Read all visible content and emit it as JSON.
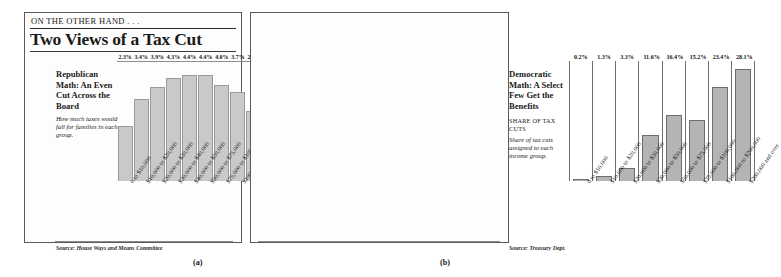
{
  "header": {
    "kicker": "ON THE OTHER HAND . . .",
    "title": "Two Views of a Tax Cut"
  },
  "panel_a": {
    "heading": "Republican Math: An Even Cut Across the Board",
    "description": "How much taxes would fall for families in each group.",
    "source": "Source: House Ways and Means Committee",
    "figure_caption": "(a)"
  },
  "panel_b": {
    "heading": "Democratic Math: A Select Few Get the Benefits",
    "subhead": "SHARE OF TAX CUTS",
    "description": "Share of tax cuts assigned to each income group.",
    "source": "Source: Treasury Dept.",
    "figure_caption": "(b)"
  },
  "colors": {
    "bar_a_fill": "#c9c9c9",
    "bar_a_stroke": "#9a9a9a",
    "bar_b_fill": "#b4b4b4",
    "bar_b_stroke": "#6d6d6d",
    "panel_border": "#5a5a5a",
    "text": "#1a1a1a"
  },
  "chart_data": [
    {
      "type": "bar",
      "title": "Republican Math: An Even Cut Across the Board",
      "subtitle": "How much taxes would fall for families in each group.",
      "xlabel": "",
      "ylabel": "",
      "ylim": [
        0,
        5.0
      ],
      "grid": false,
      "legend": "none",
      "source": "Source: House Ways and Means Committee",
      "categories": [
        "0 to $10,000",
        "$10,000 to $20,000",
        "$20,000 to $30,000",
        "$30,000 to $40,000",
        "$40,000 to $50,000",
        "$50,000 to $75,000",
        "$75,000 to $100,000",
        "$100,000 to $200,000",
        "$200,000 and over"
      ],
      "values": [
        2.3,
        3.4,
        3.9,
        4.3,
        4.4,
        4.4,
        4.0,
        3.7,
        2.9
      ],
      "data_labels": [
        "2.3%",
        "3.4%",
        "3.9%",
        "4.3%",
        "4.4%",
        "4.4%",
        "4.0%",
        "3.7%",
        "2.9%"
      ]
    },
    {
      "type": "bar",
      "title": "Democratic Math: A Select Few Get the Benefits",
      "subtitle": "Share of tax cuts assigned to each income group.",
      "series_label": "SHARE OF TAX CUTS",
      "xlabel": "",
      "ylabel": "",
      "ylim": [
        0,
        30.0
      ],
      "grid": false,
      "legend": "none",
      "source": "Source: Treasury Dept.",
      "categories": [
        "0 to $10,000",
        "$10,000 to $20,000",
        "$20,000 to $30,000",
        "$30,000 to $50,000",
        "$50,000 to $75,000",
        "$75,000 to $100,000",
        "$100,000 to $200,000",
        "$200,000 and over"
      ],
      "values": [
        0.2,
        1.3,
        3.3,
        11.6,
        16.4,
        15.2,
        23.4,
        28.1
      ],
      "data_labels": [
        "0.2%",
        "1.3%",
        "3.3%",
        "11.6%",
        "16.4%",
        "15.2%",
        "23.4%",
        "28.1%"
      ]
    }
  ]
}
